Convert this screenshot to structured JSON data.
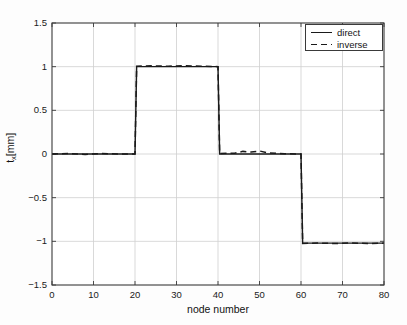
{
  "chart_data": {
    "type": "line",
    "title": "",
    "xlabel": "node number",
    "ylabel": "t_x[mm]",
    "ylabel_base": "t",
    "ylabel_sub": "x",
    "ylabel_unit": "[mm]",
    "xlim": [
      0,
      80
    ],
    "ylim": [
      -1.5,
      1.5
    ],
    "xticks": [
      0,
      10,
      20,
      30,
      40,
      50,
      60,
      70,
      80
    ],
    "xtick_labels": [
      "0",
      "10",
      "20",
      "30",
      "40",
      "50",
      "60",
      "70",
      "80"
    ],
    "yticks": [
      -1.5,
      -1,
      -0.5,
      0,
      0.5,
      1,
      1.5
    ],
    "ytick_labels": [
      "-1.5",
      "-1",
      "-0.5",
      "0",
      "0.5",
      "1",
      "1.5"
    ],
    "grid": true,
    "grid_color": "#cfcfcf",
    "axes_color": "#3a3a3a",
    "background": "#ffffff",
    "legend_position": "top-right",
    "series": [
      {
        "name": "direct",
        "style": "solid",
        "color": "#1a1a1a",
        "x": [
          0,
          20,
          20.4,
          40,
          40.4,
          60,
          60.4,
          80
        ],
        "values": [
          0,
          0,
          1.0,
          1.0,
          0.0,
          0.0,
          -1.02,
          -1.02
        ]
      },
      {
        "name": "inverse",
        "style": "dashed",
        "color": "#1a1a1a",
        "x": [
          0,
          4,
          8,
          12,
          16,
          20,
          20.4,
          24,
          28,
          32,
          36,
          40,
          40.4,
          44,
          46,
          48,
          50,
          52,
          56,
          60,
          60.4,
          64,
          68,
          72,
          76,
          80
        ],
        "values": [
          0,
          0.005,
          -0.005,
          0.005,
          0,
          0,
          1.005,
          1.01,
          1.005,
          1.012,
          1.005,
          1.0,
          0.005,
          0.01,
          0.03,
          0.022,
          0.035,
          0.012,
          0.004,
          0.0,
          -1.025,
          -1.02,
          -1.025,
          -1.018,
          -1.025,
          -1.02
        ]
      }
    ]
  },
  "legend": {
    "entries": [
      {
        "label": "direct",
        "style": "solid"
      },
      {
        "label": "inverse",
        "style": "dashed"
      }
    ]
  },
  "axis_labels": {
    "x": "node number",
    "y_base": "t",
    "y_sub": "x",
    "y_unit": "[mm]"
  }
}
